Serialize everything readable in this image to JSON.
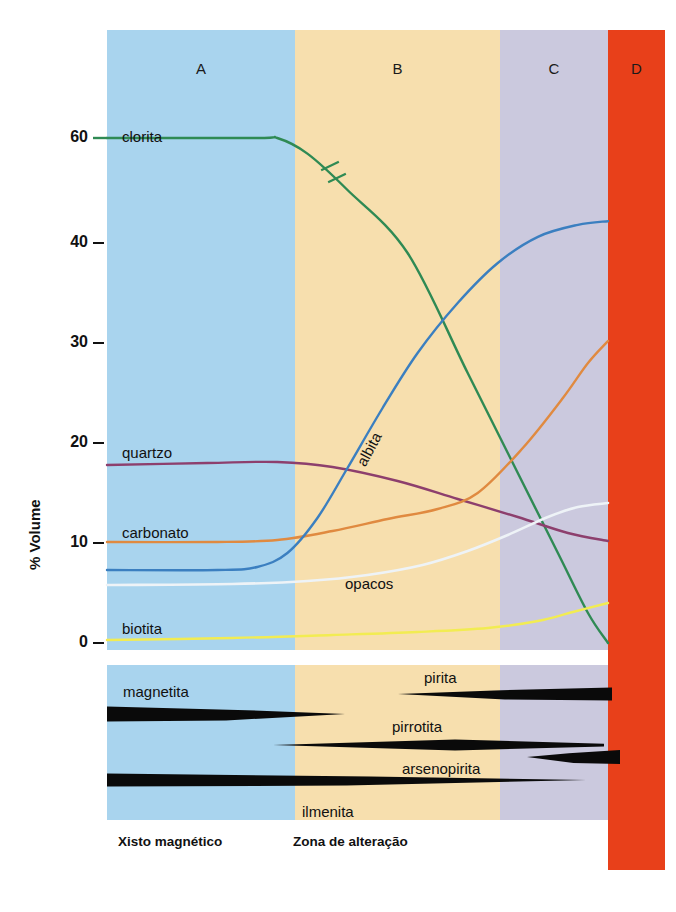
{
  "figure": {
    "zones": [
      {
        "id": "A",
        "label": "A",
        "color": "#a9d4ee",
        "x": 107,
        "width": 188
      },
      {
        "id": "B",
        "label": "B",
        "color": "#f7dfae",
        "x": 295,
        "width": 205
      },
      {
        "id": "C",
        "label": "C",
        "color": "#cbc9de",
        "x": 500,
        "width": 108
      },
      {
        "id": "D",
        "label": "D",
        "color": "#e8401a",
        "x": 608,
        "width": 57
      }
    ],
    "captions": [
      {
        "text": "Xisto magnético",
        "x": 118,
        "y": 834
      },
      {
        "text": "Zona de alteração",
        "x": 293,
        "y": 834
      }
    ]
  },
  "chart_data": {
    "type": "line",
    "title": "",
    "xlabel": "",
    "ylabel": "% Volume",
    "ylim": [
      0,
      60
    ],
    "yticks": [
      0,
      10,
      20,
      30,
      40,
      60
    ],
    "ytick_labels": [
      "0",
      "10",
      "20",
      "30",
      "40",
      "60"
    ],
    "axis_note": "eixo comprimido entre 40 e 60 (valor 50 omitido)",
    "grid": false,
    "legend": "inline labels",
    "x_categories": [
      "A",
      "B",
      "C",
      "D"
    ],
    "x_zone_boundaries_pct": [
      0,
      33.7,
      70.4,
      89.8,
      100
    ],
    "series": [
      {
        "name": "clorita",
        "color": "#2f8a54",
        "label_x": 122,
        "label_y": 128,
        "has_break_marks": true,
        "points": [
          {
            "x": 0,
            "y": 60
          },
          {
            "x": 30,
            "y": 60
          },
          {
            "x": 34,
            "y": 60
          },
          {
            "x": 40,
            "y": 57
          },
          {
            "x": 48,
            "y": 50
          },
          {
            "x": 60,
            "y": 39
          },
          {
            "x": 72,
            "y": 27
          },
          {
            "x": 82,
            "y": 17
          },
          {
            "x": 90,
            "y": 9
          },
          {
            "x": 96,
            "y": 3
          },
          {
            "x": 100,
            "y": 0
          }
        ]
      },
      {
        "name": "quartzo",
        "color": "#8d3f6d",
        "label_x": 122,
        "label_y": 444,
        "points": [
          {
            "x": 0,
            "y": 17.8
          },
          {
            "x": 20,
            "y": 18.0
          },
          {
            "x": 34,
            "y": 18.1
          },
          {
            "x": 45,
            "y": 17.6
          },
          {
            "x": 58,
            "y": 16.2
          },
          {
            "x": 70,
            "y": 14.4
          },
          {
            "x": 82,
            "y": 12.6
          },
          {
            "x": 92,
            "y": 11.0
          },
          {
            "x": 100,
            "y": 10.2
          }
        ]
      },
      {
        "name": "carbonato",
        "color": "#e08a40",
        "label_x": 122,
        "label_y": 524,
        "points": [
          {
            "x": 0,
            "y": 10.1
          },
          {
            "x": 22,
            "y": 10.1
          },
          {
            "x": 34,
            "y": 10.3
          },
          {
            "x": 45,
            "y": 11.2
          },
          {
            "x": 56,
            "y": 12.4
          },
          {
            "x": 66,
            "y": 13.4
          },
          {
            "x": 74,
            "y": 15.0
          },
          {
            "x": 83,
            "y": 19.5
          },
          {
            "x": 91,
            "y": 24.5
          },
          {
            "x": 96,
            "y": 28.0
          },
          {
            "x": 100,
            "y": 30.2
          }
        ]
      },
      {
        "name": "albita",
        "color": "#3b7fc0",
        "label_x": 368,
        "label_y": 452,
        "label_rotated": true,
        "points": [
          {
            "x": 0,
            "y": 7.3
          },
          {
            "x": 22,
            "y": 7.3
          },
          {
            "x": 30,
            "y": 7.6
          },
          {
            "x": 36,
            "y": 9.0
          },
          {
            "x": 42,
            "y": 12.5
          },
          {
            "x": 48,
            "y": 17.5
          },
          {
            "x": 55,
            "y": 23.5
          },
          {
            "x": 62,
            "y": 29.0
          },
          {
            "x": 70,
            "y": 34.0
          },
          {
            "x": 78,
            "y": 38.0
          },
          {
            "x": 86,
            "y": 41.0
          },
          {
            "x": 94,
            "y": 43.3
          },
          {
            "x": 100,
            "y": 44.0
          }
        ]
      },
      {
        "name": "opacos",
        "color": "#eef3f7",
        "label_x": 345,
        "label_y": 575,
        "points": [
          {
            "x": 0,
            "y": 5.8
          },
          {
            "x": 25,
            "y": 5.9
          },
          {
            "x": 40,
            "y": 6.2
          },
          {
            "x": 52,
            "y": 6.8
          },
          {
            "x": 63,
            "y": 7.8
          },
          {
            "x": 72,
            "y": 9.2
          },
          {
            "x": 80,
            "y": 10.8
          },
          {
            "x": 88,
            "y": 12.6
          },
          {
            "x": 94,
            "y": 13.6
          },
          {
            "x": 100,
            "y": 14.0
          }
        ]
      },
      {
        "name": "biotita",
        "color": "#f2ec52",
        "label_x": 122,
        "label_y": 620,
        "points": [
          {
            "x": 0,
            "y": 0.3
          },
          {
            "x": 25,
            "y": 0.5
          },
          {
            "x": 45,
            "y": 0.8
          },
          {
            "x": 62,
            "y": 1.1
          },
          {
            "x": 76,
            "y": 1.5
          },
          {
            "x": 86,
            "y": 2.2
          },
          {
            "x": 93,
            "y": 3.1
          },
          {
            "x": 100,
            "y": 4.0
          }
        ]
      }
    ]
  },
  "mineral_panel": {
    "type": "range-bands",
    "bands": [
      {
        "name": "magnetita",
        "label": "magnetita",
        "label_x": 123,
        "label_y": 683,
        "color": "#0a0a0a",
        "start_x": 107,
        "end_x": 345,
        "y_center": 714,
        "thickness": 15,
        "taper": "right"
      },
      {
        "name": "pirita",
        "label": "pirita",
        "label_x": 424,
        "label_y": 669,
        "color": "#0a0a0a",
        "start_x": 398,
        "end_x": 612,
        "y_center": 694,
        "thickness": 13,
        "taper": "left"
      },
      {
        "name": "pirrotita",
        "label": "pirrotita",
        "label_x": 392,
        "label_y": 718,
        "color": "#0a0a0a",
        "start_x": 273,
        "end_x": 604,
        "y_center": 745,
        "thickness": 11,
        "taper": "both"
      },
      {
        "name": "arsenopirita",
        "label": "arsenopirita",
        "label_x": 402,
        "label_y": 760,
        "color": "#0a0a0a",
        "start_x": 527,
        "end_x": 620,
        "y_center": 757,
        "thickness": 14,
        "taper": "left"
      },
      {
        "name": "ilmenita",
        "label": "ilmenita",
        "label_x": 302,
        "label_y": 803,
        "color": "#0a0a0a",
        "start_x": 107,
        "end_x": 586,
        "y_center": 780,
        "thickness": 13,
        "taper": "right"
      }
    ]
  }
}
